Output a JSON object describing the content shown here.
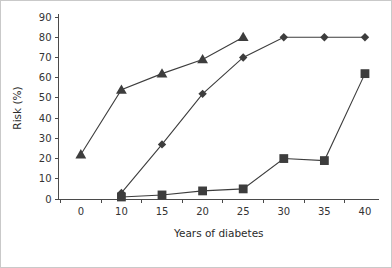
{
  "chart_data": {
    "type": "line",
    "title": "",
    "xlabel": "Years of diabetes",
    "ylabel": "Risk (%)",
    "categories": [
      "0",
      "10",
      "15",
      "20",
      "25",
      "30",
      "35",
      "40"
    ],
    "x_tick_labels": [
      "0",
      "10",
      "15",
      "20",
      "25",
      "30",
      "35",
      "40"
    ],
    "y_tick_labels": [
      "0",
      "10",
      "20",
      "30",
      "40",
      "50",
      "60",
      "70",
      "80",
      "90"
    ],
    "y_ticks": [
      0,
      10,
      20,
      30,
      40,
      50,
      60,
      70,
      80,
      90
    ],
    "ylim": [
      0,
      90
    ],
    "grid": false,
    "legend": "none",
    "marker_color": "#3d3d3d",
    "line_color": "#3d3d3d",
    "series": [
      {
        "name": "triangle-series",
        "marker": "triangle",
        "points": [
          {
            "x": "0",
            "y": 22
          },
          {
            "x": "10",
            "y": 54
          },
          {
            "x": "15",
            "y": 62
          },
          {
            "x": "20",
            "y": 69
          },
          {
            "x": "25",
            "y": 80
          }
        ]
      },
      {
        "name": "diamond-series",
        "marker": "diamond",
        "points": [
          {
            "x": "10",
            "y": 3
          },
          {
            "x": "15",
            "y": 27
          },
          {
            "x": "20",
            "y": 52
          },
          {
            "x": "25",
            "y": 70
          },
          {
            "x": "30",
            "y": 80
          },
          {
            "x": "35",
            "y": 80
          },
          {
            "x": "40",
            "y": 80
          }
        ]
      },
      {
        "name": "square-series",
        "marker": "square",
        "points": [
          {
            "x": "10",
            "y": 1
          },
          {
            "x": "15",
            "y": 2
          },
          {
            "x": "20",
            "y": 4
          },
          {
            "x": "25",
            "y": 5
          },
          {
            "x": "30",
            "y": 20
          },
          {
            "x": "35",
            "y": 19
          },
          {
            "x": "40",
            "y": 62
          }
        ]
      }
    ]
  }
}
